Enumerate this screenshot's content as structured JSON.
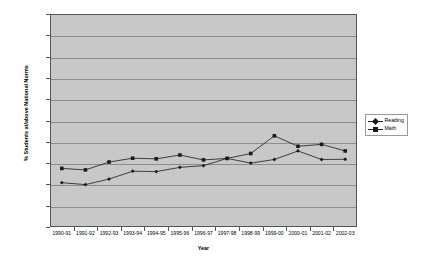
{
  "chart_data": {
    "type": "line",
    "title": "",
    "xlabel": "Year",
    "ylabel": "% Students at/above National Norms",
    "ylim": [
      0,
      100
    ],
    "yunit": "%",
    "grid": true,
    "legend_position": "right",
    "categories": [
      "1990-91",
      "1991-92",
      "1992-93",
      "1993-94",
      "1994-95",
      "1995-96",
      "1996-97",
      "1997-98",
      "1998-99",
      "1999-00",
      "2000-01",
      "2001-02",
      "2002-03"
    ],
    "ytick_labels": [
      "100.0%",
      "90.0%",
      "80.0%",
      "70.0%",
      "60.0%",
      "50.0%",
      "40.0%",
      "30.0%",
      "20.0%",
      "10.0%",
      "0.0%"
    ],
    "ytick_values": [
      100,
      90,
      80,
      70,
      60,
      50,
      40,
      30,
      20,
      10,
      0
    ],
    "series": [
      {
        "name": "Reading",
        "marker": "diamond",
        "color": "#1a1a1a",
        "values": [
          20.8,
          19.9,
          22.5,
          26.2,
          26.0,
          28.0,
          28.8,
          32.2,
          30.0,
          31.7,
          35.7,
          31.7,
          31.8
        ]
      },
      {
        "name": "Math",
        "marker": "square",
        "color": "#1a1a1a",
        "values": [
          27.5,
          26.8,
          30.5,
          32.3,
          32.0,
          33.8,
          31.5,
          32.2,
          34.5,
          42.8,
          37.9,
          38.8,
          35.7
        ]
      }
    ],
    "plot_background": "#c8c8c8",
    "gridline_color": "#8c8c8c",
    "axis_color": "#555555"
  }
}
